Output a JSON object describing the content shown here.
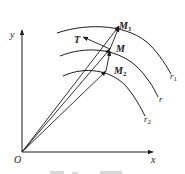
{
  "diagram": {
    "type": "vector-geometry",
    "axes": {
      "x_label": "x",
      "y_label": "y",
      "origin_label": "O"
    },
    "points": [
      {
        "id": "M1",
        "label": "M",
        "subscript": "1",
        "x": 119,
        "y": 25
      },
      {
        "id": "M",
        "label": "M",
        "subscript": "",
        "x": 110,
        "y": 48
      },
      {
        "id": "M2",
        "label": "M",
        "subscript": "2",
        "x": 106,
        "y": 70
      }
    ],
    "tangent": {
      "label": "T"
    },
    "curves": [
      {
        "id": "r1",
        "label": "r",
        "subscript": "1"
      },
      {
        "id": "r",
        "label": "r",
        "subscript": ""
      },
      {
        "id": "r2",
        "label": "r",
        "subscript": "2"
      }
    ],
    "colors": {
      "stroke": "#1a1a1a",
      "background": "#ffffff"
    }
  }
}
